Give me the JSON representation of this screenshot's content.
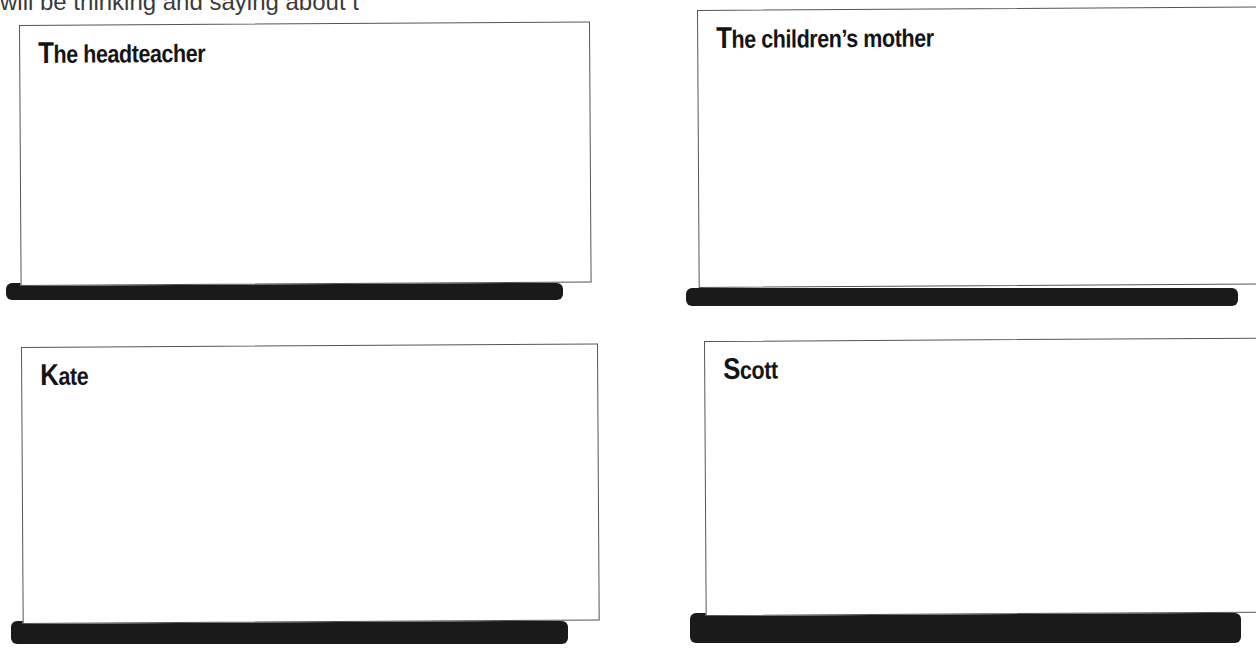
{
  "intro_text": "will be thinking and saying about t",
  "boxes": [
    {
      "initial": "T",
      "rest": "he headteacher"
    },
    {
      "initial": "T",
      "rest": "he children’s mother"
    },
    {
      "initial": "K",
      "rest": "ate"
    },
    {
      "initial": "S",
      "rest": "cott"
    }
  ]
}
